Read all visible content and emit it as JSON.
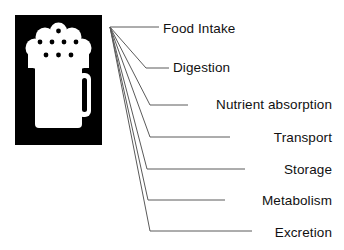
{
  "diagram": {
    "icon": {
      "name": "beer-mug-icon",
      "background_color": "#000000",
      "foreground_color": "#ffffff",
      "bubble_color": "#000000"
    },
    "line_color": "#5a5a5a",
    "text_color": "#111111",
    "labels": [
      {
        "id": "food-intake",
        "text": "Food Intake",
        "align": "left",
        "x": 163,
        "y": 22,
        "leader": {
          "bend_x": 147,
          "bend_y": 27,
          "end_x": 159,
          "end_y": 27
        }
      },
      {
        "id": "digestion",
        "text": "Digestion",
        "align": "left",
        "x": 173,
        "y": 61,
        "leader": {
          "bend_x": 146,
          "bend_y": 68,
          "end_x": 169,
          "end_y": 68
        }
      },
      {
        "id": "nutrient-absorption",
        "text": "Nutrient absorption",
        "align": "right",
        "x": 332,
        "y": 98,
        "leader": {
          "bend_x": 150,
          "bend_y": 105,
          "end_x": 188,
          "end_y": 105
        }
      },
      {
        "id": "transport",
        "text": "Transport",
        "align": "right",
        "x": 332,
        "y": 131,
        "leader": {
          "bend_x": 150,
          "bend_y": 137,
          "end_x": 230,
          "end_y": 137
        }
      },
      {
        "id": "storage",
        "text": "Storage",
        "align": "right",
        "x": 332,
        "y": 163,
        "leader": {
          "bend_x": 147,
          "bend_y": 169,
          "end_x": 245,
          "end_y": 169
        }
      },
      {
        "id": "metabolism",
        "text": "Metabolism",
        "align": "right",
        "x": 332,
        "y": 194,
        "leader": {
          "bend_x": 148,
          "bend_y": 200,
          "end_x": 225,
          "end_y": 200
        }
      },
      {
        "id": "excretion",
        "text": "Excretion",
        "align": "right",
        "x": 332,
        "y": 226,
        "leader": {
          "bend_x": 150,
          "bend_y": 231,
          "end_x": 252,
          "end_y": 231
        }
      }
    ],
    "origin": {
      "x": 110,
      "y": 27
    }
  }
}
